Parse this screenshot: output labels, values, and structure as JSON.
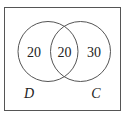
{
  "diagram": {
    "type": "venn",
    "sets": [
      {
        "label": "D",
        "only_value": "20"
      },
      {
        "label": "C",
        "only_value": "30"
      }
    ],
    "intersection_value": "20",
    "colors": {
      "stroke": "#555555",
      "text": "#222222",
      "background": "#ffffff"
    }
  }
}
